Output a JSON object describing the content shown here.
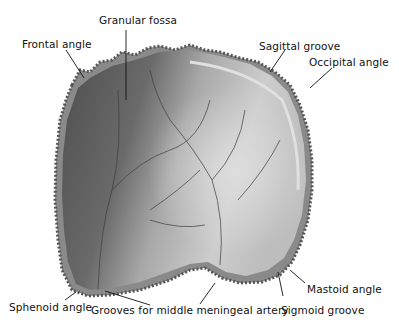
{
  "figure": {
    "colors": {
      "bone_dark": "#5a5a5a",
      "bone_light": "#cfcfcf",
      "suture": "#7a7a7a",
      "text": "#111111"
    }
  },
  "labels": [
    {
      "id": "granular-fossa",
      "text": "Granular fossa",
      "x": 99,
      "y": 14
    },
    {
      "id": "frontal-angle",
      "text": "Frontal angle",
      "x": 22,
      "y": 38
    },
    {
      "id": "sagittal-groove",
      "text": "Sagittal groove",
      "x": 259,
      "y": 40
    },
    {
      "id": "occipital-angle",
      "text": "Occipital angle",
      "x": 309,
      "y": 56
    },
    {
      "id": "mastoid-angle",
      "text": "Mastoid angle",
      "x": 307,
      "y": 283
    },
    {
      "id": "sphenoid-angle",
      "text": "Sphenoid angle",
      "x": 9,
      "y": 301
    },
    {
      "id": "grooves-middle-meningeal",
      "text": "Grooves for middle meningeal artery",
      "x": 91,
      "y": 304
    },
    {
      "id": "sigmoid-groove",
      "text": "Sigmoid groove",
      "x": 281,
      "y": 304
    }
  ]
}
